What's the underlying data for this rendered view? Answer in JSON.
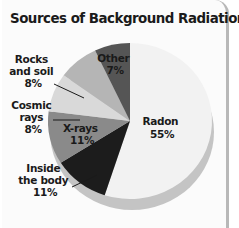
{
  "chart_data": {
    "type": "pie",
    "title": "Sources of Background Radiation",
    "categories": [
      "Radon",
      "Inside the body",
      "X-rays",
      "Cosmic rays",
      "Rocks and soil",
      "Other"
    ],
    "values": [
      55,
      11,
      11,
      8,
      8,
      7
    ],
    "unit": "%",
    "colors": [
      "#f2f2f2",
      "#1c1c1c",
      "#8a8a8a",
      "#d9d9d9",
      "#b5b5b5",
      "#555555"
    ],
    "labels": {
      "radon": {
        "line1": "Radon",
        "line2": "55%"
      },
      "inside": {
        "line1": "Inside",
        "line2": "the body",
        "line3": "11%"
      },
      "xrays": {
        "line1": "X-rays",
        "line2": "11%"
      },
      "cosmic": {
        "line1": "Cosmic",
        "line2": "rays",
        "line3": "8%"
      },
      "rocks": {
        "line1": "Rocks",
        "line2": "and soil",
        "line3": "8%"
      },
      "other": {
        "line1": "Other",
        "line2": "7%"
      }
    },
    "legend": "none (direct labels)",
    "style": "3D tilted pie"
  }
}
